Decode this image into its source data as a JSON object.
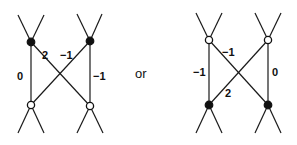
{
  "separator_text": "or",
  "diagrams": [
    {
      "name": "left",
      "nodes": {
        "top_left": {
          "type": "filled"
        },
        "top_right": {
          "type": "filled"
        },
        "bottom_left": {
          "type": "open"
        },
        "bottom_right": {
          "type": "open"
        }
      },
      "labels": {
        "left_vertical": "0",
        "diag_down": "2",
        "diag_up": "−1",
        "right_vertical": "−1"
      }
    },
    {
      "name": "right",
      "nodes": {
        "top_left": {
          "type": "open"
        },
        "top_right": {
          "type": "open"
        },
        "bottom_left": {
          "type": "filled"
        },
        "bottom_right": {
          "type": "filled"
        }
      },
      "labels": {
        "left_vertical": "−1",
        "diag_down": "−1",
        "diag_up": "2",
        "right_vertical": "0"
      }
    }
  ],
  "colors": {
    "ink": "#111111",
    "background": "#ffffff"
  }
}
